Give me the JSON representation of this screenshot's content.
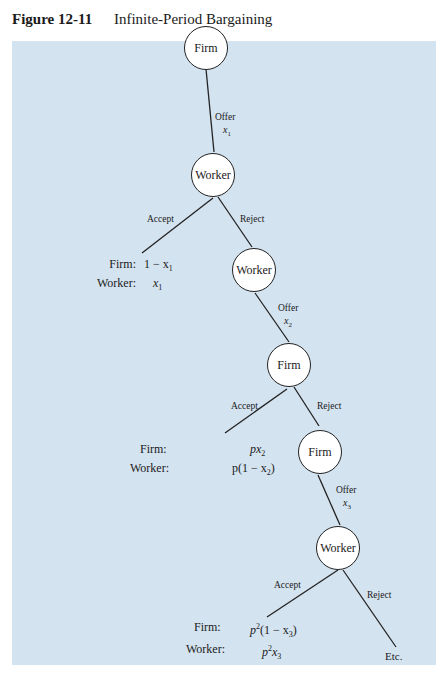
{
  "figure": {
    "number": "Figure 12-11",
    "title": "Infinite-Period Bargaining"
  },
  "colors": {
    "panel_background": "#d4e3f0",
    "node_fill": "#ffffff",
    "line": "#222222"
  },
  "nodes": [
    {
      "id": "n1",
      "label": "Firm"
    },
    {
      "id": "n2",
      "label": "Worker"
    },
    {
      "id": "n3",
      "label": "Worker"
    },
    {
      "id": "n4",
      "label": "Firm"
    },
    {
      "id": "n5",
      "label": "Firm"
    },
    {
      "id": "n6",
      "label": "Worker"
    }
  ],
  "edges": [
    {
      "from": "n1",
      "to": "n2",
      "label": "Offer",
      "var": "x",
      "sub": "1"
    },
    {
      "from": "n2",
      "to": "payoff1",
      "label": "Accept"
    },
    {
      "from": "n2",
      "to": "n3",
      "label": "Reject"
    },
    {
      "from": "n3",
      "to": "n4",
      "label": "Offer",
      "var": "x",
      "sub": "2"
    },
    {
      "from": "n4",
      "to": "payoff2",
      "label": "Accept"
    },
    {
      "from": "n4",
      "to": "n5",
      "label": "Reject"
    },
    {
      "from": "n5",
      "to": "n6",
      "label": "Offer",
      "var": "x",
      "sub": "3"
    },
    {
      "from": "n6",
      "to": "payoff3",
      "label": "Accept"
    },
    {
      "from": "n6",
      "to": "etc",
      "label": "Reject"
    }
  ],
  "payoffs": [
    {
      "firm_label": "Firm:",
      "firm_value": "1 − x",
      "firm_sub": "1",
      "worker_label": "Worker:",
      "worker_value": "x",
      "worker_sub": "1"
    },
    {
      "firm_label": "Firm:",
      "firm_value": "px",
      "firm_sub": "2",
      "worker_label": "Worker:",
      "worker_value_pre": "p(1 − x",
      "worker_sub": "2",
      "worker_value_post": ")"
    },
    {
      "firm_label": "Firm:",
      "firm_value_pre": "p",
      "firm_sup": "2",
      "firm_value_mid": "(1 − x",
      "firm_sub": "3",
      "firm_value_post": ")",
      "worker_label": "Worker:",
      "worker_value_pre": "p",
      "worker_sup": "2",
      "worker_value_mid": "x",
      "worker_sub": "3"
    }
  ],
  "terminal": "Etc."
}
